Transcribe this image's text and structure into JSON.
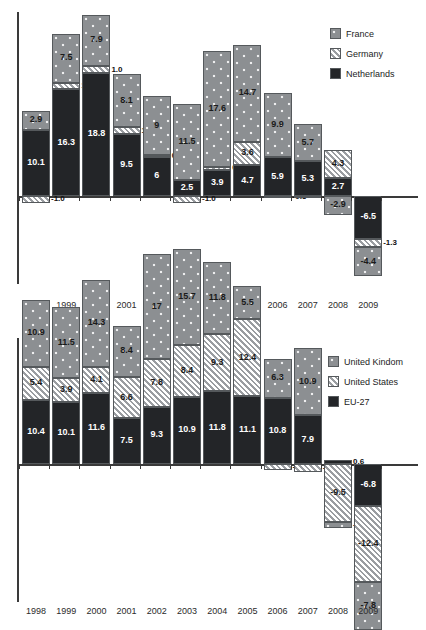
{
  "chart_data": [
    {
      "id": "top",
      "type": "bar",
      "stacked": true,
      "title": "",
      "xlabel": "",
      "ylabel": "",
      "grid": false,
      "legend_position": "top-right",
      "categories": [
        "1998",
        "1999",
        "2000",
        "2001",
        "2002",
        "2003",
        "2004",
        "2005",
        "2006",
        "2007",
        "2008",
        "2009"
      ],
      "series": [
        {
          "name": "Netherlands",
          "pattern": "solid-dark",
          "color": "#232528",
          "values": [
            10.1,
            16.3,
            18.8,
            9.5,
            6,
            2.5,
            3.9,
            4.7,
            5.9,
            5.3,
            2.7,
            -6.5
          ],
          "labels": [
            "10.1",
            "16.3",
            "18.8",
            "9.5",
            "6",
            "2.5",
            "3.9",
            "4.7",
            "5.9",
            "5.3",
            "2.7",
            "-6.5"
          ]
        },
        {
          "name": "Germany",
          "pattern": "diagonal-hatch",
          "color": "#d8dade",
          "values": [
            -1.0,
            1.0,
            1.0,
            1.0,
            0.0,
            -1.0,
            0.6,
            3.6,
            -0.3,
            -0.3,
            4.3,
            -1.3
          ],
          "labels": [
            "-1.0",
            "1.0",
            "1.0",
            "1.0",
            "0.0",
            "-1.0",
            "0.6",
            "3.6",
            "-0.3",
            "-0.3",
            "4.3",
            "-1.3"
          ]
        },
        {
          "name": "France",
          "pattern": "dotted-gray",
          "color": "#8c8f92",
          "values": [
            2.9,
            7.5,
            7.9,
            8.1,
            9,
            11.5,
            17.6,
            14.7,
            9.9,
            5.7,
            -2.9,
            -4.4
          ],
          "labels": [
            "2.9",
            "7.5",
            "7.9",
            "8.1",
            "9",
            "11.5",
            "17.6",
            "14.7",
            "9.9",
            "5.7",
            "-2.9",
            "-4.4"
          ]
        }
      ],
      "legend": [
        {
          "label": "France",
          "pattern": "dotted-gray"
        },
        {
          "label": "Germany",
          "pattern": "diagonal-hatch"
        },
        {
          "label": "Netherlands",
          "pattern": "solid-dark"
        }
      ]
    },
    {
      "id": "bottom",
      "type": "bar",
      "stacked": true,
      "title": "",
      "xlabel": "",
      "ylabel": "",
      "grid": false,
      "legend_position": "top-right",
      "categories": [
        "1998",
        "1999",
        "2000",
        "2001",
        "2002",
        "2003",
        "2004",
        "2005",
        "2006",
        "2007",
        "2008",
        "2009"
      ],
      "series": [
        {
          "name": "EU-27",
          "pattern": "solid-dark",
          "color": "#232528",
          "values": [
            10.4,
            10.1,
            11.6,
            7.5,
            9.3,
            10.9,
            11.8,
            11.1,
            10.8,
            7.9,
            0.6,
            -6.8
          ],
          "labels": [
            "10.4",
            "10.1",
            "11.6",
            "7.5",
            "9.3",
            "10.9",
            "11.8",
            "11.1",
            "10.8",
            "7.9",
            "0.6",
            "-6.8"
          ]
        },
        {
          "name": "United States",
          "pattern": "diagonal-hatch",
          "color": "#d8dade",
          "values": [
            5.4,
            3.9,
            4.1,
            6.6,
            7.8,
            8.4,
            9.3,
            12.4,
            -1,
            -1.3,
            -9.5,
            -12.4
          ],
          "labels": [
            "5.4",
            "3.9",
            "4.1",
            "6.6",
            "7.8",
            "8.4",
            "9.3",
            "12.4",
            "-1",
            "-1.3",
            "-9.5",
            "-12.4"
          ]
        },
        {
          "name": "United Kindom",
          "pattern": "dotted-gray",
          "color": "#8c8f92",
          "values": [
            10.9,
            11.5,
            14.3,
            8.4,
            17,
            15.7,
            11.8,
            5.5,
            6.3,
            10.9,
            -0.9,
            -7.8
          ],
          "labels": [
            "10.9",
            "11.5",
            "14.3",
            "8.4",
            "17",
            "15.7",
            "11.8",
            "5.5",
            "6.3",
            "10.9",
            "-0.9",
            "-7.8"
          ]
        }
      ],
      "legend": [
        {
          "label": "United Kindom",
          "pattern": "dotted-gray"
        },
        {
          "label": "United States",
          "pattern": "diagonal-hatch"
        },
        {
          "label": "EU-27",
          "pattern": "solid-dark"
        }
      ]
    }
  ]
}
